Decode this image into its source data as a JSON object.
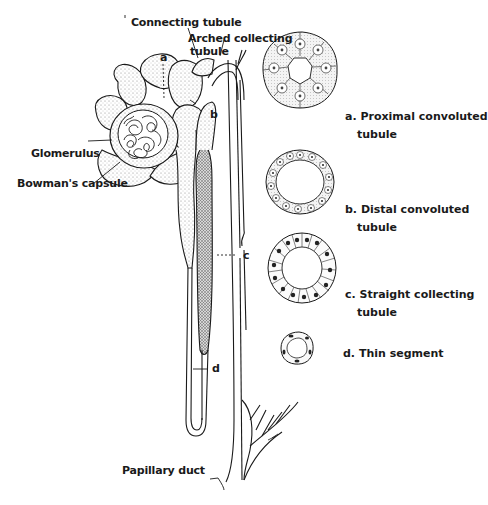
{
  "figure": {
    "labels": {
      "connecting_tubule": "Connecting tubule",
      "arched_collecting_tubule_line1": "Arched collecting",
      "arched_collecting_tubule_line2": "tubule",
      "glomerulus": "Glomerulus",
      "bowmans_capsule": "Bowman's capsule",
      "papillary_duct": "Papillary duct",
      "marker_a": "a",
      "marker_b": "b",
      "marker_c": "c",
      "marker_d": "d"
    },
    "cross_sections": [
      {
        "key": "a",
        "line1": "a. Proximal convoluted",
        "line2": "tubule"
      },
      {
        "key": "b",
        "line1": "b. Distal convoluted",
        "line2": "tubule"
      },
      {
        "key": "c",
        "line1": "c. Straight collecting",
        "line2": "tubule"
      },
      {
        "key": "d",
        "line1": "d. Thin segment",
        "line2": ""
      }
    ],
    "colors": {
      "ink": "#1a1a1a",
      "stipple": "#8a8a8a",
      "background": "#ffffff"
    }
  }
}
